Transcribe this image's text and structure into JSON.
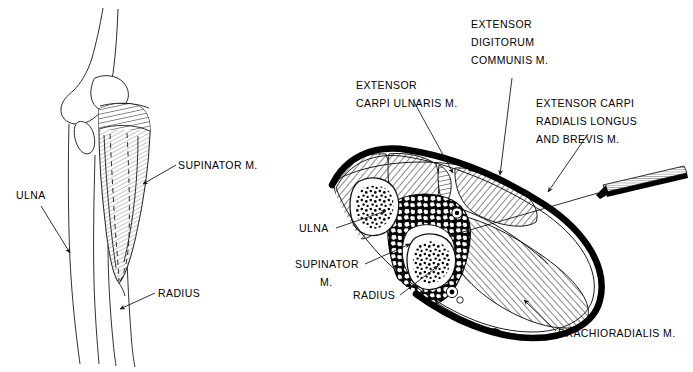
{
  "figure": {
    "background_color": "#ffffff",
    "ink_color": "#000000",
    "panels": [
      {
        "id": "lateral-view",
        "name": "lateral-forearm-view",
        "description": "Lateral view of elbow and proximal forearm showing supinator muscle"
      },
      {
        "id": "cross-section",
        "name": "forearm-cross-section",
        "description": "Transverse cross-section of proximal forearm with needle electrode insertion"
      }
    ]
  },
  "left_panel": {
    "labels": [
      {
        "id": "supinator",
        "text": "SUPINATOR  M.",
        "x": 178,
        "y": 169,
        "anchor": "start"
      },
      {
        "id": "ulna",
        "text": "ULNA",
        "x": 16,
        "y": 199,
        "anchor": "start"
      },
      {
        "id": "radius",
        "text": "RADIUS",
        "x": 158,
        "y": 297,
        "anchor": "start"
      }
    ]
  },
  "right_panel": {
    "labels": [
      {
        "id": "extensor-digitorum-communis",
        "lines": [
          "EXTENSOR",
          "DIGITORUM",
          "COMMUNIS M."
        ],
        "x": 471,
        "y": 28,
        "anchor": "start"
      },
      {
        "id": "extensor-carpi-ulnaris",
        "lines": [
          "EXTENSOR",
          "CARPI  ULNARIS M."
        ],
        "x": 356,
        "y": 89,
        "anchor": "start"
      },
      {
        "id": "extensor-carpi-radialis",
        "lines": [
          "EXTENSOR CARPI",
          "RADIALIS LONGUS",
          "AND BREVIS M."
        ],
        "x": 536,
        "y": 107,
        "anchor": "start"
      },
      {
        "id": "ulna",
        "lines": [
          "ULNA"
        ],
        "x": 299,
        "y": 232,
        "anchor": "start"
      },
      {
        "id": "supinator",
        "lines": [
          "SUPINATOR",
          "M."
        ],
        "x": 295,
        "y": 268,
        "anchor": "start"
      },
      {
        "id": "radius",
        "lines": [
          "RADIUS"
        ],
        "x": 353,
        "y": 299,
        "anchor": "start"
      },
      {
        "id": "brachioradialis",
        "lines": [
          "BRACHIORADIALIS  M."
        ],
        "x": 558,
        "y": 337,
        "anchor": "start"
      }
    ],
    "needle": {
      "name": "needle-electrode",
      "description": "EMG needle electrode inserted from lateral aspect"
    }
  },
  "anatomy_terms": {
    "supinator": "SUPINATOR  M.",
    "ulna": "ULNA",
    "radius": "RADIUS",
    "extensor_digitorum_communis": "EXTENSOR DIGITORUM COMMUNIS M.",
    "extensor_carpi_ulnaris": "EXTENSOR CARPI  ULNARIS M.",
    "extensor_carpi_radialis": "EXTENSOR CARPI RADIALIS LONGUS AND BREVIS M.",
    "brachioradialis": "BRACHIORADIALIS  M."
  }
}
